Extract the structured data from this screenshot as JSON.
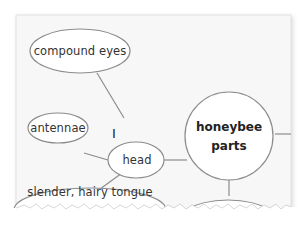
{
  "diagram": {
    "type": "concept web",
    "center": {
      "line1": "honeybee",
      "line2": "parts"
    },
    "nodes": [
      {
        "label": "compound eyes"
      },
      {
        "label": "antennae"
      },
      {
        "label": "head"
      },
      {
        "label": "slender, hairy tongue"
      }
    ],
    "mark": "I",
    "colors": {
      "paper": "#f7f7f7",
      "line": "#8c8c8c",
      "text": "#333333"
    }
  }
}
